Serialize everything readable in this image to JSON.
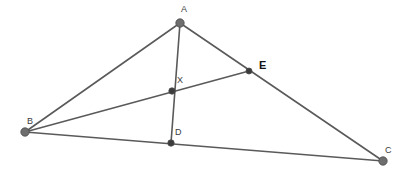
{
  "figure": {
    "type": "geometry-diagram",
    "width": 411,
    "height": 176,
    "background_color": "#ffffff",
    "line_color": "#5a5a5a",
    "line_width": 1.6,
    "vertex_fill_gray": "#6e6e6e",
    "vertex_fill_dark": "#3c3c3c",
    "vertex_stroke": "#4a4a4a"
  },
  "points": [
    {
      "id": "A",
      "label": "A",
      "x": 180,
      "y": 23,
      "radius": 4.2,
      "style": "gray",
      "label_x": 181,
      "label_y": 5,
      "bold": false
    },
    {
      "id": "B",
      "label": "B",
      "x": 25,
      "y": 132,
      "radius": 4.2,
      "style": "gray",
      "label_x": 27,
      "label_y": 117,
      "bold": false
    },
    {
      "id": "C",
      "label": "C",
      "x": 383,
      "y": 161,
      "radius": 4.2,
      "style": "gray",
      "label_x": 385,
      "label_y": 146,
      "bold": false
    },
    {
      "id": "D",
      "label": "D",
      "x": 171,
      "y": 143,
      "radius": 3.2,
      "style": "dark",
      "label_x": 175,
      "label_y": 128,
      "bold": false
    },
    {
      "id": "E",
      "label": "E",
      "x": 249,
      "y": 71,
      "radius": 3.0,
      "style": "dark",
      "label_x": 259,
      "label_y": 60,
      "bold": true
    },
    {
      "id": "X",
      "label": "X",
      "x": 172,
      "y": 91,
      "radius": 3.2,
      "style": "dark",
      "label_x": 177,
      "label_y": 76,
      "bold": false
    }
  ],
  "segments": [
    {
      "id": "AB",
      "from": "A",
      "to": "B",
      "x1": 180,
      "y1": 23,
      "x2": 25,
      "y2": 132
    },
    {
      "id": "AC",
      "from": "A",
      "to": "C",
      "x1": 180,
      "y1": 23,
      "x2": 383,
      "y2": 161
    },
    {
      "id": "BC",
      "from": "B",
      "to": "C",
      "x1": 25,
      "y1": 132,
      "x2": 383,
      "y2": 161
    },
    {
      "id": "AD",
      "from": "A",
      "to": "D",
      "x1": 180,
      "y1": 23,
      "x2": 171,
      "y2": 143
    },
    {
      "id": "BE",
      "from": "B",
      "to": "E",
      "x1": 25,
      "y1": 132,
      "x2": 249,
      "y2": 71
    }
  ],
  "labels_text": {
    "A": "A",
    "B": "B",
    "C": "C",
    "D": "D",
    "E": "E",
    "X": "X"
  }
}
